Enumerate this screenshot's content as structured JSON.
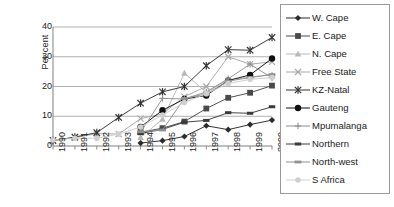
{
  "chart_data": {
    "type": "line",
    "title": "",
    "xlabel": "",
    "ylabel": "Per cent",
    "x": [
      1990,
      1991,
      1992,
      1993,
      1994,
      1995,
      1996,
      1997,
      1998,
      1999,
      2000
    ],
    "xticklabels": [
      "1990",
      "1991",
      "1992",
      "1993",
      "1994",
      "1995",
      "1996",
      "1997",
      "1998",
      "1999",
      "2000"
    ],
    "yticklabels": [
      "0",
      "10",
      "20",
      "30",
      "40"
    ],
    "yticks": [
      0,
      10,
      20,
      30,
      40
    ],
    "ylim": [
      0,
      40
    ],
    "grid": "horizontal",
    "legend_position": "right",
    "series": [
      {
        "name": "W. Cape",
        "marker": "diamond",
        "color": "#2b2b2b",
        "values": [
          null,
          null,
          null,
          null,
          1.0,
          1.8,
          3.2,
          6.8,
          5.5,
          7.2,
          8.7
        ]
      },
      {
        "name": "E. Cape",
        "marker": "square",
        "color": "#4a4a4a",
        "values": [
          null,
          null,
          null,
          null,
          4.6,
          6.0,
          8.2,
          12.6,
          16.2,
          17.9,
          20.3
        ]
      },
      {
        "name": "N. Cape",
        "marker": "triangle",
        "color": "#b8b8b8",
        "values": [
          null,
          null,
          null,
          null,
          2.9,
          9.0,
          24.5,
          18.0,
          22.2,
          23.2,
          24.0
        ]
      },
      {
        "name": "Free State",
        "marker": "x",
        "color": "#a8a8a8",
        "values": [
          2.0,
          2.8,
          4.2,
          4.0,
          9.2,
          10.8,
          16.6,
          20.0,
          30.0,
          27.5,
          28.3
        ]
      },
      {
        "name": "KZ-Natal",
        "marker": "asterisk",
        "color": "#333333",
        "values": [
          1.8,
          3.0,
          4.5,
          9.6,
          14.4,
          18.2,
          20.0,
          27.0,
          32.4,
          32.2,
          36.5
        ]
      },
      {
        "name": "Gauteng",
        "marker": "circle",
        "color": "#111111",
        "values": [
          null,
          null,
          null,
          null,
          6.4,
          12.0,
          15.8,
          17.0,
          22.0,
          23.9,
          29.4
        ]
      },
      {
        "name": "Mpumalanga",
        "marker": "plus",
        "color": "#8f8f8f",
        "values": [
          null,
          null,
          null,
          null,
          4.6,
          16.0,
          15.8,
          18.2,
          22.6,
          27.5,
          22.9
        ]
      },
      {
        "name": "Northern",
        "marker": "dash-dark",
        "color": "#3a3a3a",
        "values": [
          null,
          null,
          null,
          null,
          4.2,
          5.6,
          8.0,
          8.6,
          11.2,
          11.0,
          13.2
        ]
      },
      {
        "name": "North-west",
        "marker": "dash-gray",
        "color": "#909090",
        "values": [
          null,
          null,
          null,
          null,
          4.8,
          5.4,
          16.0,
          17.5,
          21.8,
          23.0,
          24.0
        ]
      },
      {
        "name": "S Africa",
        "marker": "circle-light",
        "color": "#cfcfcf",
        "values": [
          2.0,
          2.6,
          2.6,
          4.0,
          6.4,
          10.4,
          14.6,
          17.6,
          21.0,
          22.4,
          23.0
        ]
      }
    ]
  },
  "legend": {
    "items": [
      {
        "label": "W. Cape"
      },
      {
        "label": "E. Cape"
      },
      {
        "label": "N. Cape"
      },
      {
        "label": "Free State"
      },
      {
        "label": "KZ-Natal"
      },
      {
        "label": "Gauteng"
      },
      {
        "label": "Mpumalanga"
      },
      {
        "label": "Northern"
      },
      {
        "label": "North-west"
      },
      {
        "label": "S Africa"
      }
    ]
  }
}
